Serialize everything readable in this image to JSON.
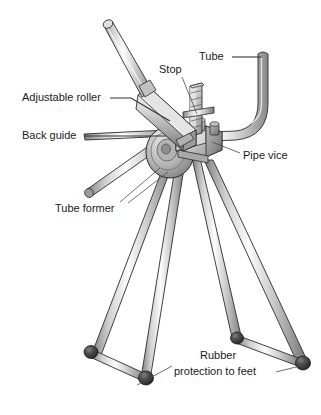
{
  "figure": {
    "background_color": "#ffffff",
    "width": 321,
    "height": 415
  },
  "labels": [
    {
      "id": "tube",
      "text": "Tube",
      "x": 199,
      "y": 57,
      "anchor": "start",
      "leader": "M 232 57 L 262 57"
    },
    {
      "id": "stop",
      "text": "Stop",
      "x": 159,
      "y": 70,
      "anchor": "start",
      "leader": "M 182 77 L 197 114"
    },
    {
      "id": "adjustable-roller",
      "text": "Adjustable roller",
      "x": 22,
      "y": 98,
      "anchor": "start",
      "leader": "M 110 98 L 131 98 L 170 121"
    },
    {
      "id": "back-guide",
      "text": "Back guide",
      "x": 22,
      "y": 136,
      "anchor": "start",
      "leader": "M 85 136 L 166 136"
    },
    {
      "id": "pipe-vice",
      "text": "Pipe vice",
      "x": 243,
      "y": 156,
      "anchor": "start",
      "leader": "M 240 153 L 212 142"
    },
    {
      "id": "tube-former",
      "text": "Tube former",
      "x": 55,
      "y": 209,
      "anchor": "start",
      "leader": "M 120 202 L 160 168"
    },
    {
      "id": "rubber-protection-line1",
      "text": "Rubber",
      "x": 200,
      "y": 356,
      "anchor": "start",
      "leader": ""
    },
    {
      "id": "rubber-protection-line2",
      "text": "protection to feet",
      "x": 174,
      "y": 372,
      "anchor": "start",
      "leader": "M 276 372 L 300 366"
    }
  ],
  "extra_leaders": [
    {
      "id": "tube-former-leader-2",
      "path": "M 128 203 L 168 172"
    },
    {
      "id": "rubber-left-foot-leader",
      "path": "M 172 366 L 137 385"
    }
  ],
  "colors": {
    "metal_light": "#f2f2f2",
    "metal_mid": "#c9c9c9",
    "metal_dark": "#9a9a9a",
    "metal_shadow": "#707070",
    "outline": "#2b2b2b",
    "rubber": "#3c3c3c",
    "rubber_highlight": "#6e6e6e",
    "text": "#1a1a1a",
    "leader": "#4a4a4a"
  },
  "parts": [
    {
      "id": "handle-bar",
      "name": "Long operating handle / lever bar"
    },
    {
      "id": "handle-shaft",
      "name": "Rectangular lever arm section"
    },
    {
      "id": "tube-workpiece",
      "name": "Bent tube workpiece (L shape)"
    },
    {
      "id": "stop-post",
      "name": "Notched stop post"
    },
    {
      "id": "pipe-vice-body",
      "name": "Pipe vice clamp block"
    },
    {
      "id": "former-wheel",
      "name": "Circular tube former wheel"
    },
    {
      "id": "back-guide-bar",
      "name": "Back guide bar"
    },
    {
      "id": "leg-1",
      "name": "Tripod leg front left"
    },
    {
      "id": "leg-2",
      "name": "Tripod leg rear left"
    },
    {
      "id": "leg-3",
      "name": "Tripod leg front right"
    },
    {
      "id": "leg-4",
      "name": "Tripod leg rear right"
    },
    {
      "id": "crossbar-left",
      "name": "Left foot crossbar"
    },
    {
      "id": "crossbar-right",
      "name": "Right foot crossbar"
    },
    {
      "id": "foot-cap-1",
      "name": "Rubber foot cap left outer"
    },
    {
      "id": "foot-cap-2",
      "name": "Rubber foot cap left inner"
    },
    {
      "id": "foot-cap-3",
      "name": "Rubber foot cap right inner"
    },
    {
      "id": "foot-cap-4",
      "name": "Rubber foot cap right outer"
    }
  ]
}
